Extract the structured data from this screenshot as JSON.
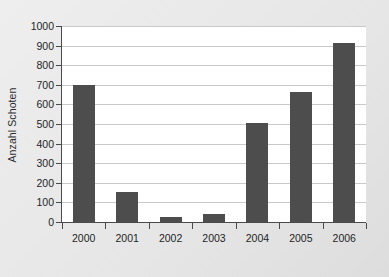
{
  "chart_data": {
    "type": "bar",
    "title": "",
    "xlabel": "",
    "ylabel": "Anzahl Schoten",
    "categories": [
      "2000",
      "2001",
      "2002",
      "2003",
      "2004",
      "2005",
      "2006"
    ],
    "values": [
      700,
      155,
      28,
      42,
      505,
      665,
      915
    ],
    "ylim": [
      0,
      1000
    ],
    "yticks": [
      0,
      100,
      200,
      300,
      400,
      500,
      600,
      700,
      800,
      900,
      1000
    ],
    "ytick_labels": [
      "0",
      "100",
      "200",
      "300",
      "400",
      "500",
      "600",
      "700",
      "800",
      "900",
      "1000"
    ],
    "grid": true,
    "legend": false,
    "series": [
      {
        "name": "Anzahl Schoten",
        "values": [
          700,
          155,
          28,
          42,
          505,
          665,
          915
        ]
      }
    ],
    "colors": {
      "bar": "#4d4d4d",
      "gridline": "#c9c9c9",
      "axis": "#4a4a4a",
      "plot_background": "#ffffff",
      "figure_background": "#e8e8e8",
      "text": "#1f1f1f"
    }
  }
}
